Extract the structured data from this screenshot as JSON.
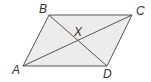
{
  "figure": {
    "type": "parallelogram-with-diagonals",
    "colors": {
      "fill": "#ececec",
      "stroke": "#555555",
      "label": "#333333"
    },
    "vertices": {
      "A": {
        "label": "A",
        "x": 23,
        "y": 66,
        "lx": 12,
        "ly": 74
      },
      "B": {
        "label": "B",
        "x": 49,
        "y": 15,
        "lx": 39,
        "ly": 13
      },
      "C": {
        "label": "C",
        "x": 132,
        "y": 15,
        "lx": 136,
        "ly": 15
      },
      "D": {
        "label": "D",
        "x": 107,
        "y": 66,
        "lx": 103,
        "ly": 78
      }
    },
    "intersection": {
      "label": "X",
      "x": 78,
      "y": 40,
      "lx": 74,
      "ly": 36
    },
    "segments": [
      {
        "name": "side-ab",
        "from": "A",
        "to": "B"
      },
      {
        "name": "side-bc",
        "from": "B",
        "to": "C"
      },
      {
        "name": "side-cd",
        "from": "C",
        "to": "D"
      },
      {
        "name": "side-da",
        "from": "D",
        "to": "A"
      },
      {
        "name": "diagonal-ac",
        "from": "A",
        "to": "C"
      },
      {
        "name": "diagonal-bd",
        "from": "B",
        "to": "D"
      }
    ]
  }
}
